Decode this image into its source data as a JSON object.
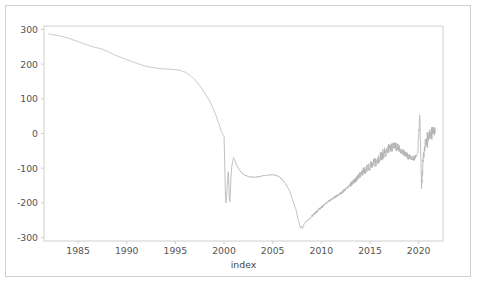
{
  "figure": {
    "background_color": "#ffffff",
    "frame_color": "#d0d0d0",
    "axes_color": "#cfcfcf",
    "line_color": "#b5b5b5",
    "tick_text_color": "#555555"
  },
  "chart_data": {
    "type": "line",
    "title": "",
    "subtitle": "",
    "xlabel": "index",
    "ylabel": "",
    "xlim": [
      1981.5,
      2022.5
    ],
    "ylim": [
      -310,
      310
    ],
    "xticks": [
      1985,
      1990,
      1995,
      2000,
      2005,
      2010,
      2015,
      2020
    ],
    "xtick_labels": [
      "1985",
      "1990",
      "1995",
      "2000",
      "2005",
      "2010",
      "2015",
      "2020"
    ],
    "yticks": [
      300,
      200,
      100,
      0,
      -100,
      -200,
      -300
    ],
    "ytick_labels": [
      "300",
      "200",
      "100",
      "0",
      "-100",
      "-200",
      "-300"
    ],
    "grid": false,
    "legend": false,
    "legend_position": "none",
    "series": [
      {
        "name": "index",
        "color": "#b5b5b5",
        "linewidth": 0.85,
        "x": [
          1982.0,
          1982.4,
          1982.8,
          1983.2,
          1983.6,
          1984.0,
          1984.5,
          1985.0,
          1985.5,
          1986.0,
          1986.5,
          1987.0,
          1987.5,
          1988.0,
          1988.5,
          1989.0,
          1989.5,
          1990.0,
          1990.5,
          1991.0,
          1991.5,
          1992.0,
          1992.5,
          1993.0,
          1993.5,
          1994.0,
          1994.5,
          1995.0,
          1995.5,
          1996.0,
          1996.5,
          1997.0,
          1997.5,
          1998.0,
          1998.4,
          1998.8,
          1999.2,
          1999.5,
          1999.7,
          1999.85,
          1999.95,
          2000.0,
          2000.05,
          2000.1,
          2000.15,
          2000.2,
          2000.25,
          2000.3,
          2000.35,
          2000.4,
          2000.45,
          2000.5,
          2000.55,
          2000.6,
          2000.65,
          2000.7,
          2000.8,
          2000.9,
          2001.0,
          2001.2,
          2001.5,
          2002.0,
          2002.5,
          2003.0,
          2003.5,
          2004.0,
          2004.5,
          2005.0,
          2005.3,
          2005.6,
          2006.0,
          2006.4,
          2006.8,
          2007.1,
          2007.4,
          2007.6,
          2007.75,
          2007.85,
          2007.95,
          2008.05,
          2008.15,
          2008.3,
          2008.5,
          2008.7,
          2008.9,
          2009.1,
          2009.4,
          2009.7,
          2010.0,
          2010.3,
          2010.6,
          2010.9,
          2011.2,
          2011.5,
          2011.8,
          2012.1,
          2012.4,
          2012.7,
          2013.0,
          2013.3,
          2013.6,
          2013.9,
          2014.2,
          2014.5,
          2014.8,
          2015.1,
          2015.4,
          2015.7,
          2016.0,
          2016.3,
          2016.6,
          2016.9,
          2017.2,
          2017.5,
          2017.8,
          2018.1,
          2018.4,
          2018.7,
          2019.0,
          2019.3,
          2019.6,
          2019.9,
          2020.0,
          2020.1,
          2020.2,
          2020.3,
          2020.5,
          2020.8,
          2021.1,
          2021.4,
          2021.7
        ],
        "y": [
          287,
          285,
          283,
          281,
          278,
          275,
          270,
          265,
          260,
          255,
          250,
          247,
          243,
          237,
          230,
          224,
          218,
          213,
          208,
          203,
          198,
          194,
          191,
          189,
          187,
          186,
          185,
          184,
          182,
          177,
          168,
          155,
          138,
          118,
          100,
          78,
          50,
          25,
          8,
          -2,
          -6,
          -8,
          -60,
          -130,
          -185,
          -200,
          -190,
          -165,
          -140,
          -120,
          -110,
          -150,
          -190,
          -197,
          -175,
          -130,
          -95,
          -78,
          -70,
          -85,
          -102,
          -118,
          -124,
          -126,
          -125,
          -122,
          -120,
          -119,
          -120,
          -124,
          -133,
          -148,
          -170,
          -196,
          -220,
          -245,
          -262,
          -271,
          -268,
          -274,
          -266,
          -258,
          -252,
          -248,
          -243,
          -237,
          -228,
          -220,
          -213,
          -206,
          -199,
          -192,
          -186,
          -182,
          -176,
          -170,
          -163,
          -156,
          -148,
          -140,
          -131,
          -122,
          -113,
          -105,
          -98,
          -92,
          -86,
          -79,
          -70,
          -60,
          -52,
          -46,
          -41,
          -38,
          -40,
          -46,
          -53,
          -62,
          -68,
          -72,
          -70,
          -55,
          -10,
          60,
          -40,
          -150,
          -60,
          -25,
          -8,
          2,
          8
        ]
      }
    ],
    "noise_bands": [
      {
        "x_start": 2013.0,
        "x_end": 2019.8,
        "amplitude": 16,
        "description": "high-frequency oscillation band"
      },
      {
        "x_start": 2019.9,
        "x_end": 2021.8,
        "amplitude": 26,
        "description": "elevated volatility after 2020 shock"
      }
    ],
    "annotations": [
      {
        "label": "peak-start",
        "x": 1982.0,
        "y": 287
      },
      {
        "label": "crash-2000",
        "x": 2000.2,
        "y": -200
      },
      {
        "label": "trough-2008",
        "x": 2007.95,
        "y": -275
      },
      {
        "label": "spike-2020-high",
        "x": 2020.3,
        "y": 140
      },
      {
        "label": "spike-2020-low",
        "x": 2020.35,
        "y": -225
      }
    ]
  }
}
